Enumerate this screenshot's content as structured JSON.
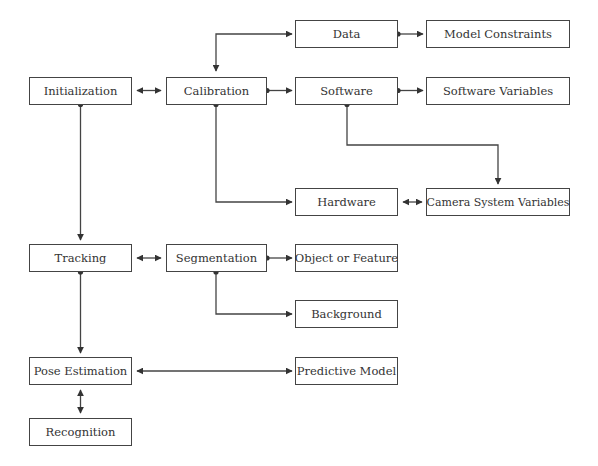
{
  "diagram": {
    "nodes": {
      "initialization": "Initialization",
      "calibration": "Calibration",
      "data": "Data",
      "model_constraints": "Model Constraints",
      "software": "Software",
      "software_variables": "Software Variables",
      "hardware": "Hardware",
      "camera_system_variables": "Camera System Variables",
      "tracking": "Tracking",
      "segmentation": "Segmentation",
      "object_or_feature": "Object or Feature",
      "background": "Background",
      "pose_estimation": "Pose Estimation",
      "predictive_model": "Predictive Model",
      "recognition": "Recognition"
    },
    "edges": [
      {
        "from": "Initialization",
        "to": "Calibration",
        "type": "bidirectional"
      },
      {
        "from": "Calibration",
        "to": "Data",
        "type": "bidirectional"
      },
      {
        "from": "Calibration",
        "to": "Software",
        "type": "directed"
      },
      {
        "from": "Calibration",
        "to": "Hardware",
        "type": "directed"
      },
      {
        "from": "Data",
        "to": "Model Constraints",
        "type": "directed"
      },
      {
        "from": "Software",
        "to": "Software Variables",
        "type": "directed"
      },
      {
        "from": "Software",
        "to": "Camera System Variables",
        "type": "directed"
      },
      {
        "from": "Hardware",
        "to": "Camera System Variables",
        "type": "bidirectional"
      },
      {
        "from": "Initialization",
        "to": "Tracking",
        "type": "directed"
      },
      {
        "from": "Tracking",
        "to": "Segmentation",
        "type": "bidirectional"
      },
      {
        "from": "Segmentation",
        "to": "Object or Feature",
        "type": "directed"
      },
      {
        "from": "Segmentation",
        "to": "Background",
        "type": "directed"
      },
      {
        "from": "Tracking",
        "to": "Pose Estimation",
        "type": "directed"
      },
      {
        "from": "Pose Estimation",
        "to": "Predictive Model",
        "type": "bidirectional"
      },
      {
        "from": "Pose Estimation",
        "to": "Recognition",
        "type": "bidirectional"
      }
    ]
  }
}
